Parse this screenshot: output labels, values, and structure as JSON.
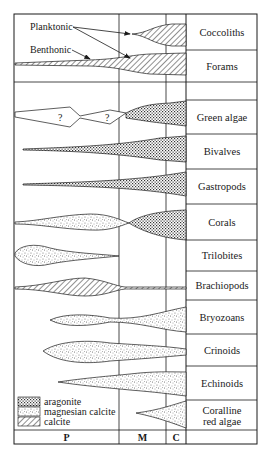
{
  "periods": [
    {
      "key": "P",
      "label": "P"
    },
    {
      "key": "M",
      "label": "M"
    },
    {
      "key": "C",
      "label": "C"
    }
  ],
  "annotations": {
    "planktonic": "Planktonic",
    "benthonic": "Benthonic",
    "question_mark": "?"
  },
  "groups": [
    {
      "name": "Coccoliths",
      "mineralogy": "calcite",
      "habit": "planktonic"
    },
    {
      "name": "Forams",
      "mineralogy": "calcite",
      "habit": "planktonic + benthonic"
    },
    {
      "name": "",
      "mineralogy": "",
      "habit": ""
    },
    {
      "name": "Green algae",
      "mineralogy": "aragonite"
    },
    {
      "name": "Bivalves",
      "mineralogy": "aragonite"
    },
    {
      "name": "Gastropods",
      "mineralogy": "aragonite"
    },
    {
      "name": "Corals",
      "mineralogy": "magnesian calcite → aragonite"
    },
    {
      "name": "Trilobites",
      "mineralogy": "magnesian calcite"
    },
    {
      "name": "Brachiopods",
      "mineralogy": "calcite"
    },
    {
      "name": "Bryozoans",
      "mineralogy": "magnesian calcite"
    },
    {
      "name": "Crinoids",
      "mineralogy": "magnesian calcite"
    },
    {
      "name": "Echinoids",
      "mineralogy": "magnesian calcite"
    },
    {
      "name": "Coralline\nred algae",
      "mineralogy": "magnesian calcite"
    }
  ],
  "labels": {
    "coccoliths": "Coccoliths",
    "forams": "Forams",
    "green_algae": "Green algae",
    "bivalves": "Bivalves",
    "gastropods": "Gastropods",
    "corals": "Corals",
    "trilobites": "Trilobites",
    "brachiopods": "Brachiopods",
    "bryozoans": "Bryozoans",
    "crinoids": "Crinoids",
    "echinoids": "Echinoids",
    "coralline_line1": "Coralline",
    "coralline_line2": "red algae"
  },
  "legend": [
    {
      "pattern": "aragonite",
      "label": "aragonite"
    },
    {
      "pattern": "magnesian-calcite",
      "label": "magnesian calcite"
    },
    {
      "pattern": "calcite",
      "label": "calcite"
    }
  ],
  "colors": {
    "line": "#1a1a1a",
    "background": "#ffffff"
  }
}
